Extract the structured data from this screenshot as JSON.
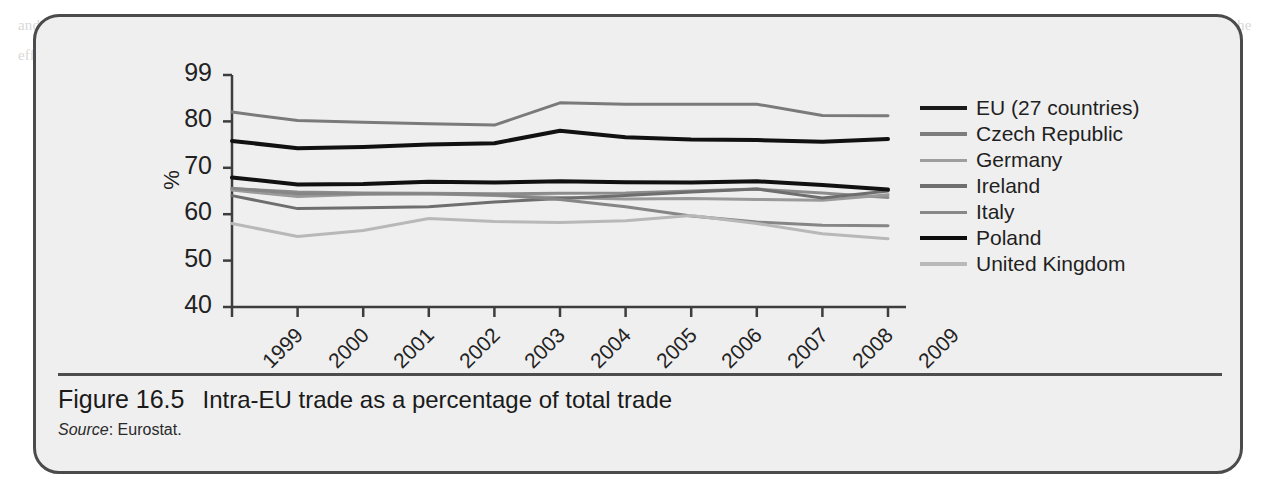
{
  "figure": {
    "number": "Figure 16.5",
    "title": "Intra-EU trade as a percentage of total trade",
    "source_word": "Source",
    "source_text": ": Eurostat."
  },
  "chart_data": {
    "type": "line",
    "title": "Intra-EU trade as a percentage of total trade",
    "xlabel": "",
    "ylabel": "%",
    "categories": [
      "1999",
      "2000",
      "2001",
      "2002",
      "2003",
      "2004",
      "2005",
      "2006",
      "2007",
      "2008",
      "2009"
    ],
    "x": [
      1999,
      2000,
      2001,
      2002,
      2003,
      2004,
      2005,
      2006,
      2007,
      2008,
      2009
    ],
    "ytick_labels": [
      "99",
      "80",
      "70",
      "60",
      "50",
      "40"
    ],
    "ytick_values": [
      90,
      80,
      70,
      60,
      50,
      40
    ],
    "ylim": [
      40,
      90
    ],
    "grid": false,
    "legend_position": "right",
    "series": [
      {
        "name": "EU (27 countries)",
        "color": "#8c8c8c",
        "width": 3,
        "values": [
          65.5,
          64.8,
          64.6,
          64.5,
          64.4,
          64.5,
          64.6,
          65.0,
          65.4,
          64.6,
          63.6
        ]
      },
      {
        "name": "Czech Republic",
        "color": "#7a7a7a",
        "width": 3,
        "values": [
          82.0,
          80.2,
          79.8,
          79.5,
          79.2,
          84.0,
          83.7,
          83.7,
          83.7,
          81.3,
          81.2
        ]
      },
      {
        "name": "Germany",
        "color": "#9a9a9a",
        "width": 3,
        "values": [
          65.2,
          63.8,
          64.3,
          64.4,
          64.0,
          63.6,
          63.3,
          63.4,
          63.2,
          63.0,
          64.2
        ]
      },
      {
        "name": "Ireland",
        "color": "#6e6e6e",
        "width": 3,
        "values": [
          64.0,
          61.2,
          61.4,
          61.6,
          62.6,
          63.4,
          64.0,
          64.8,
          65.4,
          63.5,
          65.0
        ]
      },
      {
        "name": "Italy",
        "color": "#868686",
        "width": 3,
        "values": [
          65.6,
          64.4,
          64.4,
          64.4,
          64.2,
          63.2,
          61.6,
          59.6,
          58.3,
          57.6,
          57.5
        ]
      },
      {
        "name": "Poland",
        "color": "#111111",
        "width": 4,
        "values": [
          75.8,
          74.2,
          74.5,
          75.0,
          75.3,
          78.0,
          76.6,
          76.1,
          76.0,
          75.6,
          76.2
        ]
      },
      {
        "name": "United Kingdom",
        "color": "#b8b8b8",
        "width": 3,
        "values": [
          58.0,
          55.2,
          56.5,
          59.1,
          58.4,
          58.2,
          58.6,
          59.7,
          58.0,
          55.8,
          54.7
        ]
      }
    ],
    "secondary_black_series": {
      "name": "upper-black-band",
      "color": "#111111",
      "width": 4,
      "values": [
        67.9,
        66.4,
        66.5,
        67.0,
        66.8,
        67.1,
        66.9,
        66.8,
        67.1,
        66.3,
        65.3
      ]
    }
  },
  "legend": {
    "items": [
      {
        "label": "EU (27 countries)",
        "color": "#1a1a1a",
        "width": 4
      },
      {
        "label": "Czech Republic",
        "color": "#7d7d7d",
        "width": 4
      },
      {
        "label": "Germany",
        "color": "#9e9e9e",
        "width": 3
      },
      {
        "label": "Ireland",
        "color": "#6f6f6f",
        "width": 4
      },
      {
        "label": "Italy",
        "color": "#888888",
        "width": 3
      },
      {
        "label": "Poland",
        "color": "#0d0d0d",
        "width": 4
      },
      {
        "label": "United Kingdom",
        "color": "#b9b9b9",
        "width": 4
      }
    ]
  },
  "page_bleed_text": "and  in  the  same  way  that  any  other  country  might  do.  The  question  of  whether  the  single  market  has  been  a  success  is  a  matter  of  some  debate,  since  it  is  hard  to  separate  out  the  effects  of  membership  from  other  factors  which  affect  trade  and  growth  over  the  period."
}
